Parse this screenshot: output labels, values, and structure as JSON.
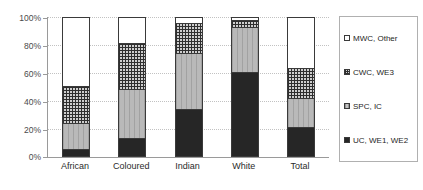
{
  "chart_data": {
    "type": "bar",
    "subtype": "stacked-100-percent",
    "title": "",
    "xlabel": "",
    "ylabel": "",
    "ylim": [
      0,
      100
    ],
    "ytick_labels": [
      "0%",
      "20%",
      "40%",
      "60%",
      "80%",
      "100%"
    ],
    "ytick_values": [
      0,
      20,
      40,
      60,
      80,
      100
    ],
    "grid": true,
    "legend_position": "right",
    "categories": [
      "African",
      "Coloured",
      "Indian",
      "White",
      "Total"
    ],
    "series": [
      {
        "name": "UC, WE1, WE2",
        "order": 0,
        "fill": "solid-dark",
        "color": "#262626",
        "values": [
          4,
          12,
          33,
          60,
          20
        ]
      },
      {
        "name": "SPC, IC",
        "order": 1,
        "fill": "light-gray-vertical-lines",
        "color": "#b9b9b9",
        "values": [
          19,
          36,
          41,
          33,
          21
        ]
      },
      {
        "name": "CWC, WE3",
        "order": 2,
        "fill": "crosshatch-grid",
        "color": "#cfcfcf",
        "values": [
          27,
          33,
          22,
          5,
          22
        ]
      },
      {
        "name": "MWC, Other",
        "order": 3,
        "fill": "white",
        "color": "#ffffff",
        "values": [
          50,
          19,
          4,
          2,
          37
        ]
      }
    ]
  },
  "legend": {
    "entries": [
      {
        "label": "MWC, Other",
        "swatch": "s3"
      },
      {
        "label": "CWC, WE3",
        "swatch": "s2"
      },
      {
        "label": "SPC, IC",
        "swatch": "s1"
      },
      {
        "label": "UC, WE1, WE2",
        "swatch": "s0"
      }
    ]
  }
}
